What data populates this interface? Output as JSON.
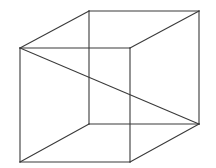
{
  "figure": {
    "name": "necker-cube",
    "title": "Necker cube wireframe line drawing",
    "background_color": "#ffffff",
    "stroke_color": "#3a3a3a",
    "stroke_width": 1.1,
    "canvas": {
      "width": 216,
      "height": 168
    },
    "projection": "oblique",
    "offset": {
      "dx": 69,
      "dy": -37
    },
    "vertices": {
      "front_top_left": {
        "x": 20,
        "y": 48
      },
      "front_top_right": {
        "x": 130,
        "y": 48
      },
      "front_bottom_right": {
        "x": 130,
        "y": 162
      },
      "front_bottom_left": {
        "x": 20,
        "y": 162
      },
      "back_top_left": {
        "x": 89,
        "y": 11
      },
      "back_top_right": {
        "x": 199,
        "y": 11
      },
      "back_bottom_right": {
        "x": 199,
        "y": 124
      },
      "back_bottom_left": {
        "x": 89,
        "y": 124
      }
    },
    "edges": [
      {
        "id": "front-top",
        "name": "front-face-top-edge",
        "x1": 20,
        "y1": 48,
        "x2": 130,
        "y2": 48
      },
      {
        "id": "front-right",
        "name": "front-face-right-edge",
        "x1": 130,
        "y1": 48,
        "x2": 130,
        "y2": 162
      },
      {
        "id": "front-bottom",
        "name": "front-face-bottom-edge",
        "x1": 130,
        "y1": 162,
        "x2": 20,
        "y2": 162
      },
      {
        "id": "front-left",
        "name": "front-face-left-edge",
        "x1": 20,
        "y1": 162,
        "x2": 20,
        "y2": 48
      },
      {
        "id": "back-top",
        "name": "back-face-top-edge",
        "x1": 89,
        "y1": 11,
        "x2": 199,
        "y2": 11
      },
      {
        "id": "back-right",
        "name": "back-face-right-edge",
        "x1": 199,
        "y1": 11,
        "x2": 199,
        "y2": 124
      },
      {
        "id": "back-bottom",
        "name": "back-face-bottom-edge",
        "x1": 199,
        "y1": 124,
        "x2": 89,
        "y2": 124
      },
      {
        "id": "back-left",
        "name": "back-face-left-edge",
        "x1": 89,
        "y1": 124,
        "x2": 89,
        "y2": 11
      },
      {
        "id": "connect-top-left",
        "name": "connecting-edge-top-left",
        "x1": 20,
        "y1": 48,
        "x2": 89,
        "y2": 11
      },
      {
        "id": "connect-top-right",
        "name": "connecting-edge-top-right",
        "x1": 130,
        "y1": 48,
        "x2": 199,
        "y2": 11
      },
      {
        "id": "connect-bottom-right",
        "name": "connecting-edge-bottom-right",
        "x1": 130,
        "y1": 162,
        "x2": 199,
        "y2": 124
      },
      {
        "id": "connect-bottom-left",
        "name": "connecting-edge-bottom-left",
        "x1": 20,
        "y1": 162,
        "x2": 89,
        "y2": 124
      }
    ],
    "long_diagonal": {
      "name": "left-to-right-diagonal",
      "x1": 20,
      "y1": 48,
      "x2": 199,
      "y2": 124
    }
  }
}
